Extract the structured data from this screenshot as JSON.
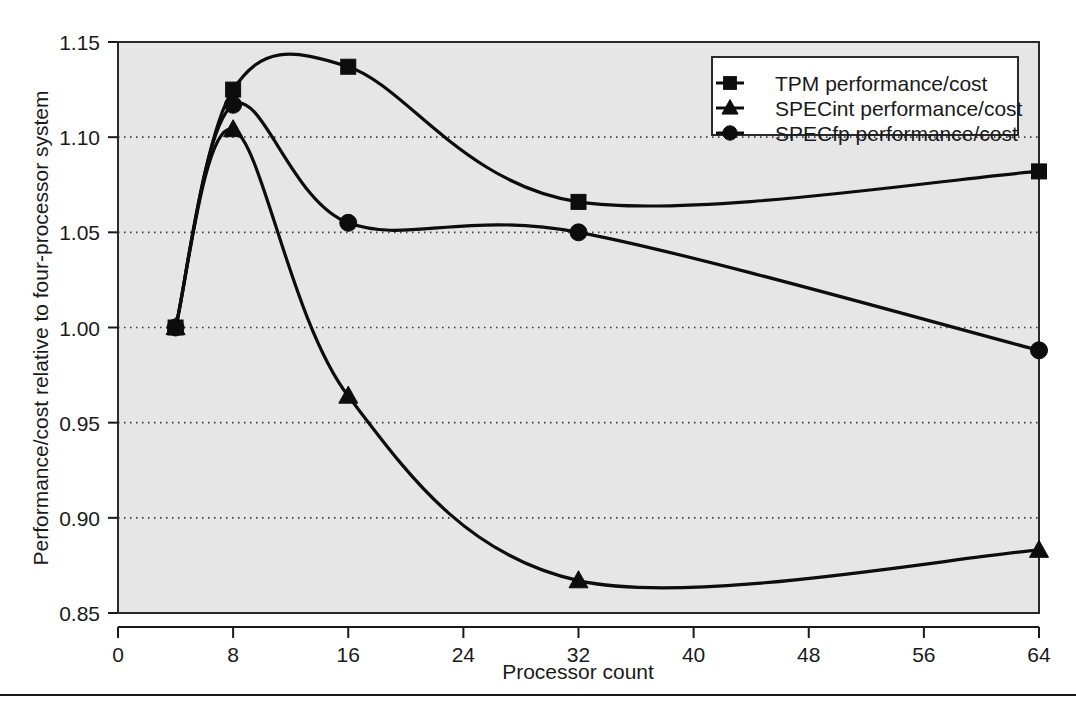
{
  "chart_data": {
    "type": "line",
    "title": "",
    "xlabel": "Processor count",
    "ylabel": "Performance/cost relative to four-processor system",
    "xlim": [
      0,
      64
    ],
    "ylim": [
      0.85,
      1.15
    ],
    "xticks": [
      0,
      8,
      16,
      24,
      32,
      40,
      48,
      56,
      64
    ],
    "xtick_labels": [
      "0",
      "8",
      "16",
      "24",
      "32",
      "40",
      "48",
      "56",
      "64"
    ],
    "yticks": [
      0.85,
      0.9,
      0.95,
      1.0,
      1.05,
      1.1,
      1.15
    ],
    "ytick_labels": [
      "0.85",
      "0.90",
      "0.95",
      "1.00",
      "1.05",
      "1.10",
      "1.15"
    ],
    "grid": "horizontal-dotted",
    "legend_position": "top-right",
    "x": [
      4,
      8,
      16,
      32,
      64
    ],
    "series": [
      {
        "name": "TPM performance/cost",
        "marker": "square",
        "values": [
          1.0,
          1.125,
          1.137,
          1.066,
          1.082
        ]
      },
      {
        "name": "SPECint performance/cost",
        "marker": "triangle",
        "values": [
          1.0,
          1.104,
          0.964,
          0.867,
          0.883
        ]
      },
      {
        "name": "SPECfp performance/cost",
        "marker": "circle",
        "values": [
          1.0,
          1.117,
          1.055,
          1.05,
          0.988
        ]
      }
    ]
  },
  "colors": {
    "plot_background": "#e6e6e6",
    "line": "#0d0d0d",
    "frame": "#2a2a2a",
    "text": "#1a1a1a",
    "page_background": "#ffffff"
  },
  "legend": {
    "items": [
      {
        "label": "TPM performance/cost",
        "marker": "square"
      },
      {
        "label": "SPECint performance/cost",
        "marker": "triangle"
      },
      {
        "label": "SPECfp performance/cost",
        "marker": "circle"
      }
    ]
  },
  "axes": {
    "x_title": "Processor count",
    "y_title": "Performance/cost relative to four-processor system"
  }
}
